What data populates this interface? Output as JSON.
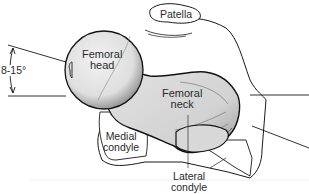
{
  "diagram": {
    "labels": {
      "patella": "Patella",
      "femoral_head_1": "Femoral",
      "femoral_head_2": "head",
      "femoral_neck_1": "Femoral",
      "femoral_neck_2": "neck",
      "medial_condyle_1": "Medial",
      "medial_condyle_2": "condyle",
      "lateral_condyle_1": "Lateral",
      "lateral_condyle_2": "condyle"
    },
    "angle": {
      "label": "8-15°",
      "description": "anteversion angle between femoral neck axis and condylar axis"
    },
    "colors": {
      "outline": "#1a1a1a",
      "bone_fill": "#e6e6e6",
      "shading": "#8a8a8a",
      "condyle_fill": "#ffffff",
      "text": "#2a2a2a"
    }
  }
}
